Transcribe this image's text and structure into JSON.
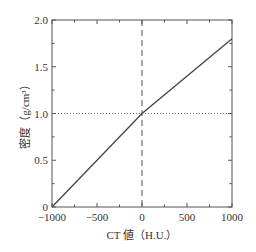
{
  "chart_data": {
    "type": "line",
    "title": "",
    "xlabel": "CT 値（H.U.）",
    "ylabel": "密度（g/cm³）",
    "xlim": [
      -1000,
      1000
    ],
    "ylim": [
      0,
      2.0
    ],
    "xticks": [
      -1000,
      -500,
      0,
      500,
      1000
    ],
    "xtick_labels": [
      "−1000",
      "−500",
      "0",
      "500",
      "1000"
    ],
    "yticks": [
      0,
      0.5,
      1.0,
      1.5,
      2.0
    ],
    "ytick_labels": [
      "0",
      "0.5",
      "1.0",
      "1.5",
      "2.0"
    ],
    "grid": false,
    "series": [
      {
        "name": "CT値-密度変換",
        "x": [
          -1000,
          0,
          1000
        ],
        "y": [
          0.0,
          1.0,
          1.8
        ],
        "style": "solid",
        "color": "#444444"
      }
    ],
    "reference_lines": [
      {
        "orientation": "vertical",
        "x": 0,
        "style": "dashed"
      },
      {
        "orientation": "horizontal",
        "y": 1.0,
        "style": "dotted"
      }
    ]
  }
}
